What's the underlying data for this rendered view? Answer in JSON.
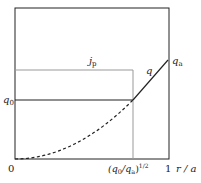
{
  "figure": {
    "type": "q-profile diagram",
    "labels": {
      "jp": "j",
      "jp_sub": "p",
      "q": "q",
      "qa": "q",
      "qa_sub": "a",
      "q0": "q",
      "q0_sub": "0",
      "origin": "0",
      "x_break": "(q",
      "x_break_sub": "0",
      "x_break_mid": "/q",
      "x_break_sub2": "a",
      "x_break_end": ")",
      "x_break_exp": "1/2",
      "x_one": "1",
      "x_axis": "r / a"
    },
    "colors": {
      "frame": "#222222",
      "current_profile": "#999999",
      "q_profile": "#222222"
    }
  }
}
